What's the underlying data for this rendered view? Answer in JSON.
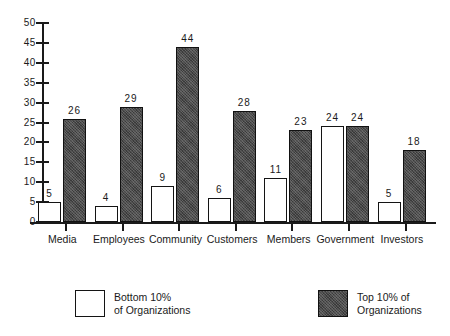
{
  "chart_data": {
    "type": "bar",
    "title": "",
    "subtitle": "",
    "xlabel": "",
    "ylabel": "",
    "ylim": [
      0,
      50
    ],
    "ytick_step": 5,
    "yticks": [
      0,
      5,
      10,
      15,
      20,
      25,
      30,
      35,
      40,
      45,
      50
    ],
    "grid": false,
    "legend_position": "bottom",
    "categories": [
      "Media",
      "Employees",
      "Community",
      "Customers",
      "Members",
      "Government",
      "Investors"
    ],
    "series": [
      {
        "name": "Bottom 10% of Organizations",
        "legend_line1": "Bottom  10%",
        "legend_line2": "of  Organizations",
        "fill": "white",
        "color": "#ffffff",
        "border_color": "#141414",
        "values": [
          5,
          4,
          9,
          6,
          11,
          24,
          5
        ]
      },
      {
        "name": "Top 10% of Organizations",
        "legend_line1": "Top 10% of",
        "legend_line2": "Organizations",
        "fill": "stipple-dark",
        "color": "#4a4a4a",
        "border_color": "#111111",
        "values": [
          26,
          29,
          44,
          28,
          23,
          24,
          18
        ]
      }
    ],
    "data_labels": {
      "bottom10": [
        "5",
        "4",
        "9",
        "6",
        "11",
        "24",
        "5"
      ],
      "top10": [
        "26",
        "29",
        "44",
        "28",
        "23",
        "24",
        "18"
      ]
    }
  },
  "axis": {
    "y_tick_labels": [
      "50",
      "45",
      "40",
      "35",
      "30",
      "25",
      "20",
      "15",
      "10",
      "5",
      "0"
    ]
  }
}
